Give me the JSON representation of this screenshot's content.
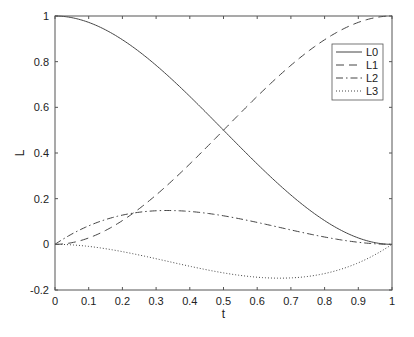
{
  "chart_data": {
    "type": "line",
    "title": "",
    "xlabel": "t",
    "ylabel": "L",
    "xlim": [
      0,
      1
    ],
    "ylim": [
      -0.2,
      1
    ],
    "xticks": [
      "0",
      "0.1",
      "0.2",
      "0.3",
      "0.4",
      "0.5",
      "0.6",
      "0.7",
      "0.8",
      "0.9",
      "1"
    ],
    "yticks": [
      "-0.2",
      "0",
      "0.2",
      "0.4",
      "0.6",
      "0.8",
      "1"
    ],
    "grid": false,
    "legend_position": "upper right",
    "x": [
      0,
      0.1,
      0.2,
      0.3,
      0.4,
      0.5,
      0.6,
      0.7,
      0.8,
      0.9,
      1
    ],
    "series": [
      {
        "name": "L0",
        "style": "solid",
        "values": [
          1,
          0.972,
          0.896,
          0.784,
          0.648,
          0.5,
          0.352,
          0.216,
          0.104,
          0.028,
          0
        ]
      },
      {
        "name": "L1",
        "style": "dashed",
        "values": [
          0,
          0.028,
          0.104,
          0.216,
          0.352,
          0.5,
          0.648,
          0.784,
          0.896,
          0.972,
          1
        ]
      },
      {
        "name": "L2",
        "style": "dashdot",
        "values": [
          0,
          0.081,
          0.128,
          0.147,
          0.144,
          0.125,
          0.096,
          0.063,
          0.032,
          0.009,
          0
        ]
      },
      {
        "name": "L3",
        "style": "dotted",
        "values": [
          0,
          -0.009,
          -0.032,
          -0.063,
          -0.096,
          -0.125,
          -0.144,
          -0.147,
          -0.128,
          -0.081,
          0
        ]
      }
    ]
  },
  "legend": {
    "items": [
      "L0",
      "L1",
      "L2",
      "L3"
    ]
  },
  "axes": {
    "xlabel": "t",
    "ylabel": "L"
  }
}
